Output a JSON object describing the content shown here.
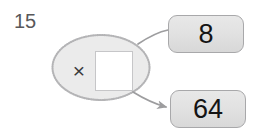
{
  "page": {
    "background_color": "#ffffff",
    "width": 259,
    "height": 138
  },
  "question": {
    "number": "15"
  },
  "machine": {
    "operation_symbol": "×",
    "operation_name": "multiply",
    "shape": "ellipse",
    "fill_color": "#ebebeb",
    "border_color": "#b4b4b6",
    "border_style": "dotted",
    "input_box": {
      "value": "",
      "placeholder": "",
      "fill_color": "#ffffff",
      "border_color": "#c6c6c8"
    }
  },
  "values": {
    "top_label": "8",
    "bottom_label": "64"
  },
  "connectors": [
    {
      "name": "input-connector",
      "from": "value-box-top",
      "to": "machine",
      "has_arrowhead": false,
      "color": "#9d9d9f"
    },
    {
      "name": "output-connector",
      "from": "machine",
      "to": "value-box-bottom",
      "has_arrowhead": true,
      "color": "#9d9d9f"
    }
  ],
  "colors": {
    "text_dark": "#141414",
    "question_number": "#58585a",
    "operator": "#3a3a3c",
    "box_border": "#a8a8aa",
    "box_fill": "#e4e4e4",
    "line": "#9d9d9f"
  }
}
